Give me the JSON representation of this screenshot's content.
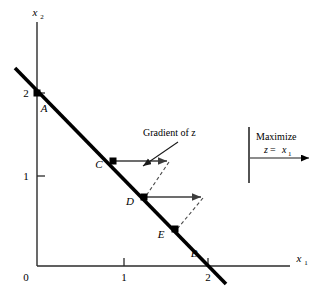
{
  "figure": {
    "title": "",
    "axes": {
      "x": {
        "label": "x",
        "subscript": "1",
        "ticks": [
          {
            "value": 0,
            "label": "0",
            "px": 37
          },
          {
            "value": 1,
            "label": "1",
            "px": 124
          },
          {
            "value": 2,
            "label": "2",
            "px": 208
          }
        ]
      },
      "y": {
        "label": "x",
        "subscript": "2",
        "ticks": [
          {
            "value": 1,
            "label": "1",
            "py": 176
          },
          {
            "value": 2,
            "label": "2",
            "py": 93
          }
        ]
      }
    },
    "constraint_line": {
      "description": "x1 + x2 = 2",
      "x1_intercept": 2,
      "x2_intercept": 2,
      "from": {
        "x": 15,
        "y": 68
      },
      "to": {
        "x": 226,
        "y": 284
      }
    },
    "points": [
      {
        "id": "A",
        "label": "A",
        "x": 0.0,
        "y": 2.0,
        "px": 37,
        "py": 93,
        "label_px": 44,
        "label_py": 110
      },
      {
        "id": "C",
        "label": "C",
        "x": 0.9,
        "y": 1.1,
        "px": 113,
        "py": 161,
        "label_px": 98,
        "label_py": 168
      },
      {
        "id": "D",
        "label": "D",
        "x": 1.25,
        "y": 0.78,
        "px": 144,
        "py": 197,
        "label_px": 128,
        "label_py": 204
      },
      {
        "id": "E",
        "label": "E",
        "x": 1.6,
        "y": 0.42,
        "px": 175,
        "py": 229,
        "label_px": 160,
        "label_py": 237
      },
      {
        "id": "B",
        "label": "B",
        "x": 2.0,
        "y": 0.0,
        "px": 208,
        "py": 266,
        "label_px": 192,
        "label_py": 256
      }
    ],
    "gradient_arrows": [
      {
        "from_point": "C",
        "x1": 113,
        "y1": 161,
        "x2": 169,
        "y2": 161
      },
      {
        "from_point": "D",
        "x1": 144,
        "y1": 197,
        "x2": 203,
        "y2": 197
      }
    ],
    "dashed_links": [
      {
        "from": {
          "x": 169,
          "y": 161
        },
        "to": {
          "x": 144,
          "y": 197
        }
      },
      {
        "from": {
          "x": 203,
          "y": 197
        },
        "to": {
          "x": 176,
          "y": 229
        }
      }
    ],
    "annotation": {
      "text": "Gradient of z",
      "text_px": 143,
      "text_py": 135,
      "arrow": {
        "x1": 178,
        "y1": 143,
        "x2": 142,
        "y2": 167
      }
    },
    "legend": {
      "line1": "Maximize",
      "line2_var": "z",
      "line2_eq": " = ",
      "line2_val": "x",
      "line2_sub": "1",
      "bar": {
        "x": 249,
        "y1": 127,
        "y2": 183
      },
      "arrow": {
        "x1": 250,
        "y1": 157,
        "x2": 311,
        "y2": 157
      }
    },
    "colors": {
      "ink": "#000000",
      "axis": "#3a3a3a",
      "arrow": "#555555",
      "dashed": "#6a6a6a",
      "background": "#ffffff"
    }
  }
}
